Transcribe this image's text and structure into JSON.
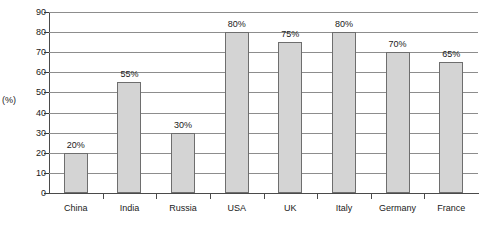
{
  "chart_data": {
    "type": "bar",
    "title": "",
    "xlabel": "",
    "ylabel": "(%)",
    "ylim": [
      0,
      90
    ],
    "ytick_step": 10,
    "grid": true,
    "legend": null,
    "categories": [
      "China",
      "India",
      "Russia",
      "USA",
      "UK",
      "Italy",
      "Germany",
      "France"
    ],
    "values": [
      20,
      55,
      30,
      80,
      75,
      80,
      70,
      65
    ],
    "data_labels": [
      "20%",
      "55%",
      "30%",
      "80%",
      "75%",
      "80%",
      "70%",
      "65%"
    ],
    "ytick_labels": [
      "0",
      "10",
      "20",
      "30",
      "40",
      "50",
      "60",
      "70",
      "80",
      "90"
    ],
    "bar_color": "#d4d4d4",
    "bar_border_color": "#6e6e6e",
    "gridline_color": "#8d8d8d",
    "axis_color": "#4a4a4a"
  },
  "caption": {
    "text": ""
  }
}
